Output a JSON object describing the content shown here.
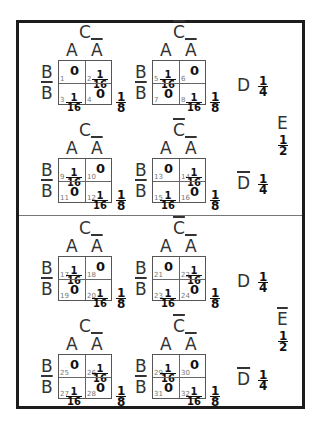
{
  "labels": {
    "A": "A",
    "A_bar": "A",
    "B": "B",
    "B_bar": "B",
    "C": "C",
    "C_bar": "C",
    "D": "D",
    "D_bar": "D",
    "E": "E",
    "E_bar": "E"
  },
  "fractions": {
    "one_eighth": {
      "n": "1",
      "d": "8"
    },
    "one_quarter": {
      "n": "1",
      "d": "4"
    },
    "one_half": {
      "n": "1",
      "d": "2"
    },
    "one_sixteenth": {
      "n": "1",
      "d": "16"
    }
  },
  "sections": [
    {
      "e_label": "E",
      "e_bar": false,
      "e_prob": {
        "n": "1",
        "d": "2"
      },
      "rows": [
        {
          "d_label": "D",
          "d_bar": false,
          "d_prob": {
            "n": "1",
            "d": "4"
          },
          "maps": [
            {
              "c_label": "C",
              "c_bar": false,
              "sum": {
                "n": "1",
                "d": "8"
              },
              "cells": [
                {
                  "num": "1",
                  "val": "0"
                },
                {
                  "num": "2",
                  "val": "1/16"
                },
                {
                  "num": "3",
                  "val": "1/16"
                },
                {
                  "num": "4",
                  "val": "0"
                }
              ]
            },
            {
              "c_label": "C",
              "c_bar": true,
              "sum": {
                "n": "1",
                "d": "8"
              },
              "cells": [
                {
                  "num": "5",
                  "val": "1/16"
                },
                {
                  "num": "6",
                  "val": "0"
                },
                {
                  "num": "7",
                  "val": "0"
                },
                {
                  "num": "8",
                  "val": "1/16"
                }
              ]
            }
          ]
        },
        {
          "d_label": "D",
          "d_bar": true,
          "d_prob": {
            "n": "1",
            "d": "4"
          },
          "maps": [
            {
              "c_label": "C",
              "c_bar": false,
              "sum": {
                "n": "1",
                "d": "8"
              },
              "cells": [
                {
                  "num": "9",
                  "val": "1/16"
                },
                {
                  "num": "10",
                  "val": "0"
                },
                {
                  "num": "11",
                  "val": "0"
                },
                {
                  "num": "12",
                  "val": "1/16"
                }
              ]
            },
            {
              "c_label": "C",
              "c_bar": true,
              "sum": {
                "n": "1",
                "d": "8"
              },
              "cells": [
                {
                  "num": "13",
                  "val": "0"
                },
                {
                  "num": "14",
                  "val": "1/16"
                },
                {
                  "num": "15",
                  "val": "1/16"
                },
                {
                  "num": "16",
                  "val": "0"
                }
              ]
            }
          ]
        }
      ]
    },
    {
      "e_label": "E",
      "e_bar": true,
      "e_prob": {
        "n": "1",
        "d": "2"
      },
      "rows": [
        {
          "d_label": "D",
          "d_bar": false,
          "d_prob": {
            "n": "1",
            "d": "4"
          },
          "maps": [
            {
              "c_label": "C",
              "c_bar": false,
              "sum": {
                "n": "1",
                "d": "8"
              },
              "cells": [
                {
                  "num": "17",
                  "val": "1/16"
                },
                {
                  "num": "18",
                  "val": "0"
                },
                {
                  "num": "19",
                  "val": "0"
                },
                {
                  "num": "20",
                  "val": "1/16"
                }
              ]
            },
            {
              "c_label": "C",
              "c_bar": true,
              "sum": {
                "n": "1",
                "d": "8"
              },
              "cells": [
                {
                  "num": "21",
                  "val": "0"
                },
                {
                  "num": "22",
                  "val": "1/16"
                },
                {
                  "num": "23",
                  "val": "1/16"
                },
                {
                  "num": "24",
                  "val": "0"
                }
              ]
            }
          ]
        },
        {
          "d_label": "D",
          "d_bar": true,
          "d_prob": {
            "n": "1",
            "d": "4"
          },
          "maps": [
            {
              "c_label": "C",
              "c_bar": false,
              "sum": {
                "n": "1",
                "d": "8"
              },
              "cells": [
                {
                  "num": "25",
                  "val": "0"
                },
                {
                  "num": "26",
                  "val": "1/16"
                },
                {
                  "num": "27",
                  "val": "1/16"
                },
                {
                  "num": "28",
                  "val": "0"
                }
              ]
            },
            {
              "c_label": "C",
              "c_bar": true,
              "sum": {
                "n": "1",
                "d": "8"
              },
              "cells": [
                {
                  "num": "29",
                  "val": "1/16"
                },
                {
                  "num": "30",
                  "val": "0"
                },
                {
                  "num": "31",
                  "val": "0"
                },
                {
                  "num": "32",
                  "val": "1/16"
                }
              ]
            }
          ]
        }
      ]
    }
  ]
}
